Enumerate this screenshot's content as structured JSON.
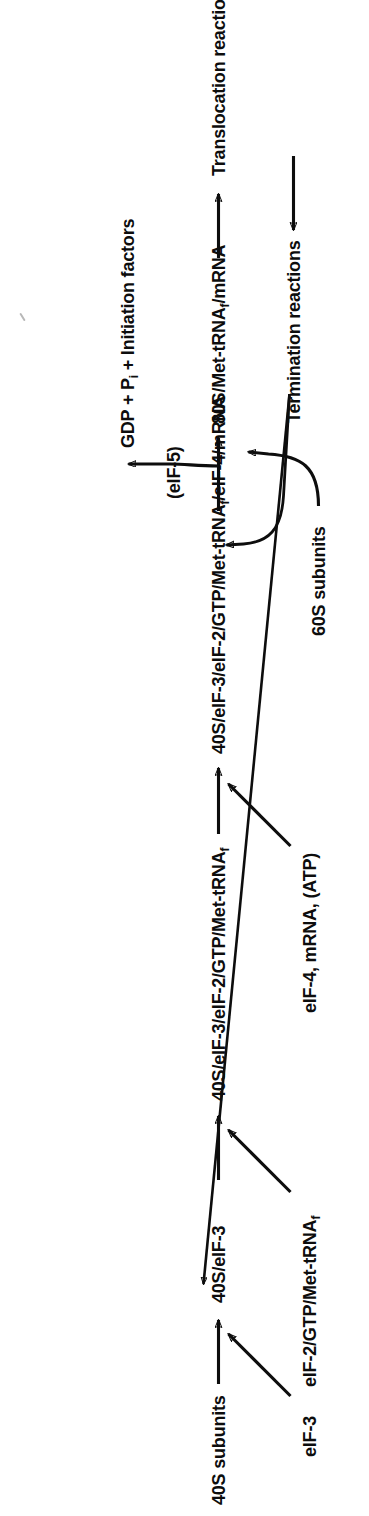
{
  "figure": {
    "orientation": "rotated-90-ccw",
    "ink_color": "#0d0d0d",
    "background": "#ffffff"
  },
  "nodes": {
    "subunits_40s": "40S subunits",
    "eif3_input": "eIF-3",
    "complex_40s_eif3": "40S/eIF-3",
    "eif2_gtp_met_trna_input_a": "eIF-2/GTP/Met-tRNA",
    "eif2_gtp_met_trna_input_b": "f",
    "complex_40s_eif3_eif2_a": "40S/eIF-3/eIF-2/GTP/Met-tRNA",
    "complex_40s_eif3_eif2_b": "f",
    "eif4_mrna_atp_input": "eIF-4, mRNA, (ATP)",
    "complex_full_a": "40S/eIF-3/eIF-2/GTP/Met-tRNA",
    "complex_full_b": "f",
    "complex_full_c": "/eIF-4/mRNA",
    "eif5_label": "(eIF-5)",
    "gdp_products_a": "GDP + P",
    "gdp_products_b": "i",
    "gdp_products_c": " + Initiation factors",
    "subunits_60s": "60S subunits",
    "complex_80s_a": "80S/Met-tRNA",
    "complex_80s_b": "f",
    "complex_80s_c": "/mRNA",
    "translocation": "Translocation reactions",
    "termination": "Termination reactions"
  },
  "edges": [
    {
      "name": "40S-subunits-to-40S-eIF-3",
      "kind": "straight-arrow"
    },
    {
      "name": "eIF-3-into-chain",
      "kind": "diagonal-arrow"
    },
    {
      "name": "40S-eIF-3-to-ternary-complex",
      "kind": "straight-arrow"
    },
    {
      "name": "eIF-2-GTP-Met-tRNA-into-chain",
      "kind": "diagonal-arrow"
    },
    {
      "name": "ternary-to-full-initiation-complex",
      "kind": "straight-arrow"
    },
    {
      "name": "eIF-4-mRNA-ATP-into-chain",
      "kind": "diagonal-arrow"
    },
    {
      "name": "full-complex-to-80S",
      "kind": "straight-arrow"
    },
    {
      "name": "eIF-5-branch-to-GDP-products",
      "kind": "curved-arrow"
    },
    {
      "name": "60S-subunits-into-80S",
      "kind": "curved-arrow"
    },
    {
      "name": "80S-to-translocation",
      "kind": "straight-arrow"
    },
    {
      "name": "translocation-to-termination",
      "kind": "straight-arrow"
    },
    {
      "name": "termination-recycle-to-40S-eIF-3",
      "kind": "diagonal-arrow"
    },
    {
      "name": "termination-recycle-to-60S",
      "kind": "curved-arrow"
    }
  ]
}
